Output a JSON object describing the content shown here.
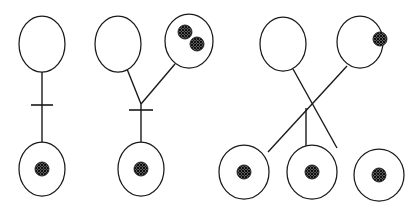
{
  "figure": {
    "width": 416,
    "height": 210,
    "background_color": "#ffffff",
    "stroke_color": "#1a1a1a",
    "marker_fill_color": "#4d4d4d",
    "marker_pattern": "cross-hatch"
  },
  "panels": [
    {
      "id": "panel-1",
      "label": "Panel 1",
      "description": "Single parent cell connected by a ticked vertical line to one daughter cell containing one marker.",
      "junction_type": "straight-line-with-tick",
      "parent_count": 1,
      "child_count": 1,
      "has_tick": true,
      "nodes": [
        {
          "id": "p1-parent-1",
          "role": "parent",
          "cx": 42,
          "cy": 44,
          "rx": 23,
          "ry": 28,
          "marker_count": 0,
          "markers": []
        },
        {
          "id": "p1-child-1",
          "role": "child",
          "cx": 42,
          "cy": 169,
          "rx": 23,
          "ry": 27,
          "marker_count": 1,
          "markers": [
            {
              "dx": 0,
              "dy": 0,
              "r": 7
            }
          ]
        }
      ],
      "edges": [
        {
          "from": "p1-parent-1",
          "x1": 42,
          "y1": 72,
          "x2": 42,
          "y2": 142
        }
      ],
      "ticks": [
        {
          "x": 42,
          "y": 105,
          "half_width": 11
        }
      ]
    },
    {
      "id": "panel-2",
      "label": "Panel 2",
      "description": "Two parent cells, one empty and one with two markers, converge at a ticked junction leading to one daughter cell with one marker.",
      "junction_type": "v-junction-with-tick",
      "parent_count": 2,
      "child_count": 1,
      "has_tick": true,
      "junction": {
        "x": 141,
        "y": 104
      },
      "nodes": [
        {
          "id": "p2-parent-1",
          "role": "parent",
          "cx": 118,
          "cy": 44,
          "rx": 23,
          "ry": 28,
          "marker_count": 0,
          "markers": []
        },
        {
          "id": "p2-parent-2",
          "role": "parent",
          "cx": 189,
          "cy": 41,
          "rx": 24,
          "ry": 27,
          "marker_count": 2,
          "markers": [
            {
              "dx": -4,
              "dy": -9,
              "r": 7
            },
            {
              "dx": 8,
              "dy": 3,
              "r": 7
            }
          ]
        },
        {
          "id": "p2-child-1",
          "role": "child",
          "cx": 141,
          "cy": 169,
          "rx": 23,
          "ry": 27,
          "marker_count": 1,
          "markers": [
            {
              "dx": 0,
              "dy": 0,
              "r": 7
            }
          ]
        }
      ],
      "edges": [
        {
          "from": "p2-parent-1",
          "x1": 127,
          "y1": 69,
          "x2": 141,
          "y2": 104
        },
        {
          "from": "p2-parent-2",
          "x1": 175,
          "y1": 64,
          "x2": 141,
          "y2": 104
        },
        {
          "from": "junction",
          "x1": 141,
          "y1": 104,
          "x2": 141,
          "y2": 142
        }
      ],
      "ticks": [
        {
          "x": 141,
          "y": 110,
          "half_width": 12
        }
      ]
    },
    {
      "id": "panel-3",
      "label": "Panel 3",
      "description": "Two parent cells, one empty and one with a single edge marker, cross at a central junction fanning out to three daughter cells each with one marker.",
      "junction_type": "crossing-junction",
      "parent_count": 2,
      "child_count": 3,
      "has_tick": false,
      "junction": {
        "x": 306,
        "y": 108
      },
      "nodes": [
        {
          "id": "p3-parent-1",
          "role": "parent",
          "cx": 283,
          "cy": 44,
          "rx": 23,
          "ry": 27,
          "marker_count": 0,
          "markers": []
        },
        {
          "id": "p3-parent-2",
          "role": "parent",
          "cx": 360,
          "cy": 42,
          "rx": 23,
          "ry": 26,
          "marker_count": 1,
          "markers": [
            {
              "dx": 20,
              "dy": -3,
              "r": 7
            }
          ]
        },
        {
          "id": "p3-child-1",
          "role": "child",
          "cx": 244,
          "cy": 172,
          "rx": 25,
          "ry": 27,
          "marker_count": 1,
          "markers": [
            {
              "dx": 0,
              "dy": 0,
              "r": 7
            }
          ]
        },
        {
          "id": "p3-child-2",
          "role": "child",
          "cx": 312,
          "cy": 172,
          "rx": 25,
          "ry": 27,
          "marker_count": 1,
          "markers": [
            {
              "dx": 0,
              "dy": 0,
              "r": 7
            }
          ]
        },
        {
          "id": "p3-child-3",
          "role": "child",
          "cx": 379,
          "cy": 175,
          "rx": 25,
          "ry": 26,
          "marker_count": 1,
          "markers": [
            {
              "dx": 0,
              "dy": 0,
              "r": 7
            }
          ]
        }
      ],
      "edges": [
        {
          "from": "p3-parent-1",
          "x1": 293,
          "y1": 69,
          "x2": 337,
          "y2": 148
        },
        {
          "from": "p3-parent-2",
          "x1": 347,
          "y1": 66,
          "x2": 268,
          "y2": 152
        },
        {
          "from": "junction",
          "x1": 306,
          "y1": 108,
          "x2": 306,
          "y2": 146
        }
      ],
      "ticks": []
    }
  ]
}
